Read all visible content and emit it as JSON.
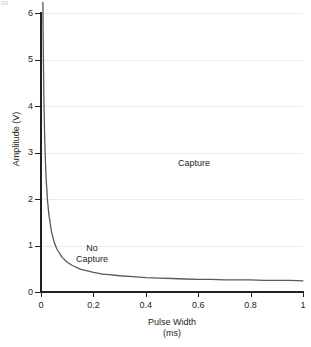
{
  "chart_data": {
    "type": "line",
    "title": "",
    "subtitle": "",
    "xlabel": "Pulse Width",
    "xlabel_unit": "(ms)",
    "ylabel": "Amplitude (V)",
    "xlim": [
      0,
      1
    ],
    "ylim": [
      0,
      6
    ],
    "grid": "horizontal",
    "legend": "none",
    "xticks": [
      0,
      0.2,
      0.4,
      0.6,
      0.8,
      1
    ],
    "xtick_labels": [
      "0",
      "0.2",
      "0.4",
      "0.6",
      "0.8",
      "1"
    ],
    "yticks": [
      0,
      1,
      2,
      3,
      4,
      5,
      6
    ],
    "ytick_labels": [
      "0",
      "1",
      "2",
      "3",
      "4",
      "5",
      "6"
    ],
    "series": [
      {
        "name": "Strength-duration curve",
        "color": "#58595b",
        "model": "amplitude = rheobase * (1 + chronaxie / pulse_width)",
        "rheobase_v": 0.2,
        "chronaxie_ms": 0.22,
        "x": [
          0.0073,
          0.008,
          0.009,
          0.01,
          0.012,
          0.014,
          0.016,
          0.018,
          0.02,
          0.025,
          0.03,
          0.04,
          0.05,
          0.06,
          0.08,
          0.1,
          0.12,
          0.15,
          0.2,
          0.24,
          0.25,
          0.3,
          0.35,
          0.4,
          0.45,
          0.5,
          0.55,
          0.6,
          0.65,
          0.7,
          0.75,
          0.8,
          0.85,
          0.9,
          0.95,
          1.0
        ],
        "y": [
          6.23,
          5.7,
          5.09,
          4.6,
          3.87,
          3.34,
          2.95,
          2.64,
          2.4,
          1.96,
          1.67,
          1.3,
          1.08,
          0.93,
          0.75,
          0.64,
          0.57,
          0.49,
          0.42,
          0.38,
          0.38,
          0.35,
          0.33,
          0.31,
          0.3,
          0.29,
          0.28,
          0.27,
          0.27,
          0.26,
          0.26,
          0.26,
          0.25,
          0.25,
          0.25,
          0.24
        ]
      }
    ],
    "annotations": [
      {
        "text": "Capture",
        "x": 0.52,
        "y": 2.9
      },
      {
        "text": "No\nCapture",
        "x": 0.14,
        "y": 1.05
      }
    ],
    "colors": {
      "curve": "#58595b",
      "axis": "#231f20",
      "gridline": "#ececec",
      "text": "#231f20",
      "background": "#ffffff"
    }
  },
  "axes": {
    "y_title": "Amplitude (V)",
    "x_title": "Pulse Width",
    "x_unit": "(ms)",
    "y_ticks": [
      {
        "value": 6,
        "label": "6",
        "top": 13
      },
      {
        "value": 5,
        "label": "5",
        "top": 59.5
      },
      {
        "value": 4,
        "label": "4",
        "top": 106
      },
      {
        "value": 3,
        "label": "3",
        "top": 152.5
      },
      {
        "value": 2,
        "label": "2",
        "top": 199
      },
      {
        "value": 1,
        "label": "1",
        "top": 245.5
      },
      {
        "value": 0,
        "label": "0",
        "top": 292
      }
    ],
    "x_ticks": [
      {
        "value": 0,
        "label": "0",
        "left": 41
      },
      {
        "value": 0.2,
        "label": "0.2",
        "left": 93.4
      },
      {
        "value": 0.4,
        "label": "0.4",
        "left": 145.8
      },
      {
        "value": 0.6,
        "label": "0.6",
        "left": 198.2
      },
      {
        "value": 0.8,
        "label": "0.8",
        "left": 250.6
      },
      {
        "value": 1,
        "label": "1",
        "left": 303
      }
    ]
  },
  "annotations": {
    "capture": "Capture",
    "no_capture": "No\nCapture"
  }
}
